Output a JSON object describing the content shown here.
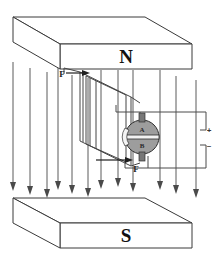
{
  "figure": {
    "caption": ""
  },
  "magnets": {
    "north": {
      "label": "N",
      "name": "north-pole-magnet",
      "position": "top"
    },
    "south": {
      "label": "S",
      "name": "south-pole-magnet",
      "position": "bottom"
    }
  },
  "field": {
    "direction": "downward",
    "line_count": 12,
    "arrow_glyph": "down-arrow",
    "line_color": "#5a5a5a",
    "lines_x": [
      13,
      30,
      47,
      58,
      72,
      88,
      101,
      118,
      133,
      160,
      176,
      196
    ],
    "line_top_y": 62,
    "line_bottom_y": 191
  },
  "coil": {
    "name": "current-loop",
    "color": "#454545",
    "description": "rectangular current loop drawn in perspective"
  },
  "commutator": {
    "name": "split-ring-commutator",
    "segments": [
      {
        "label": "A",
        "name": "commutator-segment-a"
      },
      {
        "label": "B",
        "name": "commutator-segment-b"
      }
    ],
    "fill_color": "#9d9d9d",
    "center": {
      "x": 142,
      "y": 137
    },
    "radius": 17
  },
  "forces": [
    {
      "label": "F",
      "name": "force-label-upper",
      "x": 62,
      "y": 75,
      "direction": "right"
    },
    {
      "label": "F",
      "name": "force-label-lower",
      "x": 135,
      "y": 170,
      "direction": "left"
    }
  ],
  "terminals": [
    {
      "label": "+",
      "name": "positive-terminal",
      "x": 206,
      "y": 130
    },
    {
      "label": "–",
      "name": "negative-terminal",
      "x": 206,
      "y": 145
    }
  ],
  "colors": {
    "background": "#ffffff",
    "outline": "#3a3a3a",
    "field_line": "#5a5a5a",
    "commutator": "#9d9d9d",
    "text": "#111111"
  }
}
